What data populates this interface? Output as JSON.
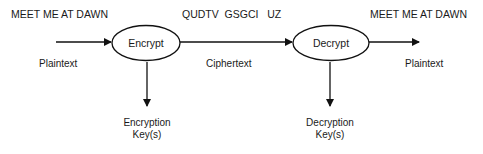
{
  "diagram": {
    "nodes": [
      {
        "id": "encrypt",
        "label": "Encrypt",
        "shape": "ellipse"
      },
      {
        "id": "decrypt",
        "label": "Decrypt",
        "shape": "ellipse"
      }
    ],
    "texts": {
      "plaintext_in_message": "MEET ME AT DAWN",
      "ciphertext_message": "QUDTV  GSGCI   UZ",
      "plaintext_out_message": "MEET ME AT DAWN",
      "plaintext_in_label": "Plaintext",
      "ciphertext_label": "Ciphertext",
      "plaintext_out_label": "Plaintext",
      "encryption_key_line1": "Encryption",
      "encryption_key_line2": "Key(s)",
      "decryption_key_line1": "Decryption",
      "decryption_key_line2": "Key(s)"
    },
    "edges": [
      {
        "from": "input",
        "to": "encrypt",
        "label": "Plaintext"
      },
      {
        "from": "encrypt",
        "to": "decrypt",
        "label": "Ciphertext"
      },
      {
        "from": "decrypt",
        "to": "output",
        "label": "Plaintext"
      },
      {
        "from": "encrypt",
        "to": "encryption-keys"
      },
      {
        "from": "decrypt",
        "to": "decryption-keys"
      }
    ],
    "colors": {
      "stroke": "#111111",
      "text": "#1a1a1a",
      "background": "#ffffff"
    }
  }
}
